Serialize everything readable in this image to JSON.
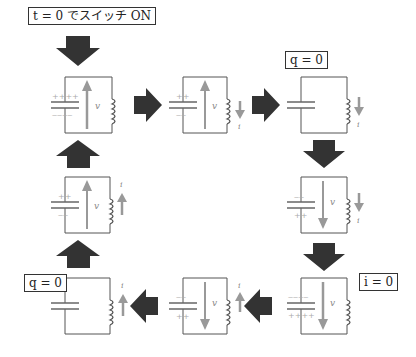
{
  "labels": {
    "start": "t = 0 でスイッチ ON",
    "q_zero_top": "q = 0",
    "i_zero": "i = 0",
    "q_zero_bottom": "q = 0"
  },
  "symbols": {
    "voltage": "v",
    "current": "i"
  },
  "colors": {
    "wire": "#555555",
    "arrow_block": "#333333",
    "arrow_gray": "#9a9a9a",
    "charge": "#aaaaaa"
  },
  "states": [
    {
      "id": 1,
      "cap_top": "++++",
      "cap_bottom": "----",
      "v": "up",
      "i": "none"
    },
    {
      "id": 2,
      "cap_top": "++",
      "cap_bottom": "--",
      "v": "up",
      "i": "down"
    },
    {
      "id": 3,
      "cap_top": "",
      "cap_bottom": "",
      "v": "none",
      "i": "down",
      "note": "q = 0"
    },
    {
      "id": 4,
      "cap_top": "--",
      "cap_bottom": "++",
      "v": "down",
      "i": "down"
    },
    {
      "id": 5,
      "cap_top": "----",
      "cap_bottom": "++++",
      "v": "down",
      "i": "none",
      "note": "i = 0"
    },
    {
      "id": 6,
      "cap_top": "--",
      "cap_bottom": "++",
      "v": "down",
      "i": "up"
    },
    {
      "id": 7,
      "cap_top": "",
      "cap_bottom": "",
      "v": "none",
      "i": "up",
      "note": "q = 0"
    },
    {
      "id": 8,
      "cap_top": "++",
      "cap_bottom": "--",
      "v": "up",
      "i": "up"
    }
  ]
}
